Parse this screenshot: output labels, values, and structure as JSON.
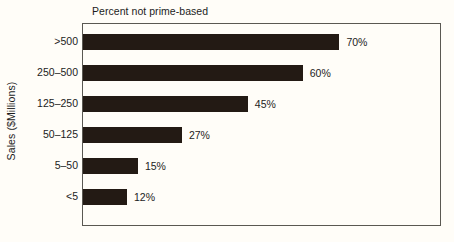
{
  "chart_data": {
    "type": "bar",
    "orientation": "horizontal",
    "title": "Percent not prime-based",
    "xlabel": "",
    "ylabel": "Sales ($Millions)",
    "categories": [
      ">500",
      "250–500",
      "125–250",
      "50–125",
      "5–50",
      "<5"
    ],
    "values": [
      70,
      60,
      45,
      27,
      15,
      12
    ],
    "value_labels": [
      "70%",
      "60%",
      "45%",
      "27%",
      "15%",
      "12%"
    ],
    "xlim": [
      0,
      98
    ],
    "ylim": null,
    "grid": false,
    "legend": null,
    "bar_color": "#231a14",
    "background_color": "#fffdf8",
    "frame_color": "#5a5852",
    "text_color": "#1c1c1c"
  }
}
